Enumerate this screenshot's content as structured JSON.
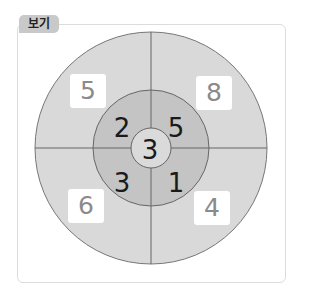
{
  "label": "보기",
  "colors": {
    "outer_ring": "#d9d9d9",
    "middle_ring": "#c4c4c4",
    "center": "#dadada",
    "line": "#666666",
    "box_text": "#8a8a8a"
  },
  "outer": {
    "top_left": "5",
    "top_right": "8",
    "bottom_left": "6",
    "bottom_right": "4"
  },
  "middle": {
    "top_left": "2",
    "top_right": "5",
    "bottom_left": "3",
    "bottom_right": "1"
  },
  "center": "3"
}
